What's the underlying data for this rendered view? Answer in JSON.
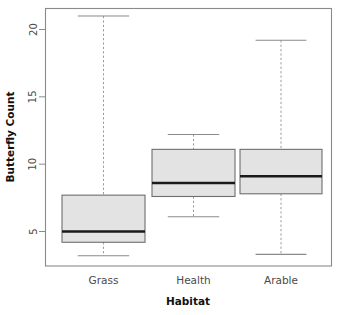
{
  "chart_data": {
    "type": "box",
    "title": "",
    "xlabel": "Habitat",
    "ylabel": "Butterfly Count",
    "categories": [
      "Grass",
      "Health",
      "Arable"
    ],
    "ylim": [
      3.0,
      21.6
    ],
    "yticks": [
      5,
      10,
      15,
      20
    ],
    "ytick_labels": [
      "5",
      "10",
      "15",
      "20"
    ],
    "grid": false,
    "legend": null,
    "box_fill_color": "#e3e3e3",
    "box_border_color": "#6e6e6e",
    "median_color": "#1a1a1a",
    "whisker_color": "#9a9a9a",
    "boxes": [
      {
        "category": "Grass",
        "whisker_low": 3.2,
        "q1": 4.2,
        "median": 5.0,
        "q3": 7.7,
        "whisker_high": 21.0,
        "outliers": []
      },
      {
        "category": "Health",
        "whisker_low": 6.1,
        "q1": 7.6,
        "median": 8.6,
        "q3": 11.1,
        "whisker_high": 12.2,
        "outliers": []
      },
      {
        "category": "Arable",
        "whisker_low": 3.3,
        "q1": 7.8,
        "median": 9.1,
        "q3": 11.1,
        "whisker_high": 19.2,
        "outliers": []
      }
    ]
  },
  "axes": {
    "y_title": "Butterfly Count",
    "x_title": "Habitat"
  }
}
